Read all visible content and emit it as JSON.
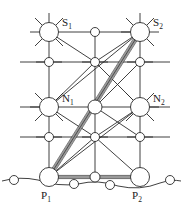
{
  "diagram": {
    "type": "lattice-structure",
    "labels": [
      {
        "id": "S1",
        "base": "S",
        "sub": "1",
        "x": 64,
        "y": 22
      },
      {
        "id": "S2",
        "base": "S",
        "sub": "2",
        "x": 155,
        "y": 22
      },
      {
        "id": "N1",
        "base": "N",
        "sub": "1",
        "x": 64,
        "y": 99
      },
      {
        "id": "N2",
        "base": "N",
        "sub": "2",
        "x": 155,
        "y": 99
      },
      {
        "id": "P1",
        "base": "P",
        "sub": "1",
        "x": 42,
        "y": 200
      },
      {
        "id": "P2",
        "base": "P",
        "sub": "2",
        "x": 133,
        "y": 200
      }
    ],
    "nodes": {
      "S1": {
        "x": 49,
        "y": 32,
        "r": 9.5,
        "kind": "large"
      },
      "S2": {
        "x": 140,
        "y": 32,
        "r": 9.5,
        "kind": "large"
      },
      "N1": {
        "x": 49,
        "y": 107,
        "r": 9.5,
        "kind": "large"
      },
      "N2": {
        "x": 140,
        "y": 107,
        "r": 9.5,
        "kind": "large"
      },
      "P1": {
        "x": 49,
        "y": 177,
        "r": 9.5,
        "kind": "large"
      },
      "P2": {
        "x": 140,
        "y": 177,
        "r": 9.5,
        "kind": "large"
      },
      "Mtop": {
        "x": 95,
        "y": 32,
        "r": 4.5,
        "kind": "small"
      },
      "Mmid": {
        "x": 95,
        "y": 107,
        "r": 6.5,
        "kind": "medium"
      },
      "Mbot": {
        "x": 95,
        "y": 177,
        "r": 5.0,
        "kind": "small"
      },
      "r2a": {
        "x": 49,
        "y": 62,
        "r": 4.5,
        "kind": "small"
      },
      "r2b": {
        "x": 95,
        "y": 62,
        "r": 4.5,
        "kind": "small"
      },
      "r2c": {
        "x": 140,
        "y": 62,
        "r": 4.5,
        "kind": "small"
      },
      "r4a": {
        "x": 49,
        "y": 137,
        "r": 4.5,
        "kind": "small"
      },
      "r4b": {
        "x": 95,
        "y": 137,
        "r": 4.5,
        "kind": "small"
      },
      "r4c": {
        "x": 140,
        "y": 137,
        "r": 4.5,
        "kind": "small"
      },
      "surf1": {
        "x": 14,
        "y": 180,
        "r": 4.5,
        "kind": "small"
      },
      "surf2": {
        "x": 74,
        "y": 183,
        "r": 4.5,
        "kind": "small"
      },
      "surf3": {
        "x": 110,
        "y": 184,
        "r": 4.5,
        "kind": "small"
      },
      "surf4": {
        "x": 170,
        "y": 180,
        "r": 4.5,
        "kind": "small"
      }
    },
    "highlighted_bonds": [
      {
        "from": "S2",
        "to": "P1",
        "style": "double-thick"
      },
      {
        "from": "P1",
        "to": "P2",
        "style": "double-thick"
      },
      {
        "from": "P1",
        "to": "Mbot",
        "style": "double-thick"
      }
    ],
    "colors": {
      "line": "#2b2b2b",
      "highlight": "#8f8f8f",
      "fill": "#ffffff",
      "label": "#1a1a1a",
      "background": "#ffffff"
    },
    "surface": {
      "description": "wavy substrate surface line",
      "path": "M 2 181 Q 20 177 38 181 Q 58 187 78 184 Q 98 180 118 186 Q 140 191 160 184 Q 172 180 181 181"
    }
  }
}
